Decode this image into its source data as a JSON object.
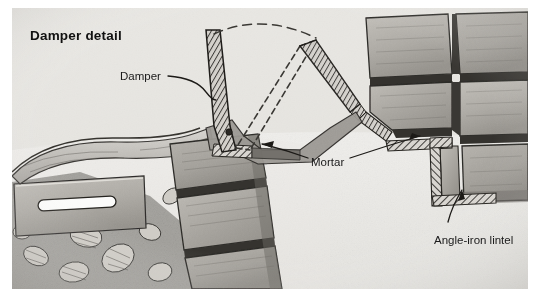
{
  "figure": {
    "title": "Damper detail",
    "kind": "technical-illustration",
    "medium": "pencil drawing",
    "background_color": "#ffffff",
    "paper_color": "#f2f1ef",
    "ink_color": "#1a1a1a"
  },
  "labels": {
    "damper": "Damper",
    "mortar": "Mortar",
    "lintel": "Angle-iron lintel"
  },
  "parts": {
    "damper_plate": "damper plate closed position",
    "damper_open": "damper plate open position (dashed)",
    "swing_arc": "damper swing arc (dashed)",
    "smoke_shelf": "smoke shelf",
    "vent_block": "vent block with slot",
    "rubble_fill": "rubble aggregate fill",
    "masonry_blocks": "concrete masonry units",
    "mortar_joints": "mortar joints",
    "angle_iron": "angle-iron lintel (hatched steel)"
  },
  "colors": {
    "block_light": "#b9b7b2",
    "block_mid": "#a5a29c",
    "block_dark": "#8d8a84",
    "joint_dark": "#3b3936",
    "steel_hatch": "#4a4845",
    "rubble": "#6d6a65",
    "paper": "#f2f1ef"
  }
}
